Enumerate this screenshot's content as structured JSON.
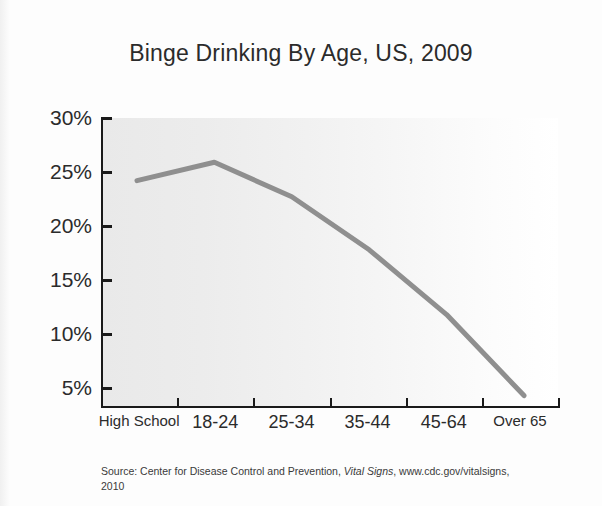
{
  "figure": {
    "title": "Binge Drinking By Age, US, 2009",
    "source_prefix": "Source: Center for Disease Control and Prevention, ",
    "source_italic": "Vital Signs",
    "source_suffix": ", www.cdc.gov/vitalsigns, 2010"
  },
  "axes": {
    "y_ticks": [
      "30%",
      "25%",
      "20%",
      "15%",
      "10%",
      "5%"
    ],
    "x_ticks": [
      "High School",
      "18-24",
      "25-34",
      "35-44",
      "45-64",
      "Over 65"
    ]
  },
  "colors": {
    "line": "#8f8f8f",
    "axis": "#1a1a1a",
    "plot_background": "#ebebeb",
    "text": "#2b2b2b"
  },
  "chart_data": {
    "type": "line",
    "title": "Binge Drinking By Age, US, 2009",
    "xlabel": "",
    "ylabel": "",
    "categories": [
      "High School",
      "18-24",
      "25-34",
      "35-44",
      "45-64",
      "Over 65"
    ],
    "values": [
      24.2,
      25.9,
      22.7,
      17.8,
      11.8,
      4.3
    ],
    "ylim": [
      0,
      30
    ],
    "ytick_values": [
      30,
      25,
      20,
      15,
      10,
      5
    ],
    "ytick_labels": [
      "30%",
      "25%",
      "20%",
      "15%",
      "10%",
      "5%"
    ],
    "grid": false,
    "legend": "none",
    "series": [
      {
        "name": "Binge drinking prevalence",
        "values": [
          24.2,
          25.9,
          22.7,
          17.8,
          11.8,
          4.3
        ]
      }
    ],
    "annotations": [],
    "source": "Source: Center for Disease Control and Prevention, Vital Signs, www.cdc.gov/vitalsigns, 2010"
  }
}
